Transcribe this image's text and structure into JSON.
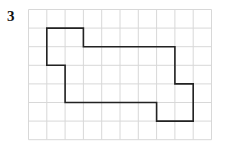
{
  "problem_number": "3",
  "grid": {
    "cols": 10,
    "rows": 7,
    "origin_x": 28.5,
    "origin_y": 9.5,
    "cell_w": 18.3,
    "cell_h": 18.6,
    "line_color": "#d8d8d8"
  },
  "shape": {
    "stroke": "#222222",
    "vertices": [
      [
        1,
        1
      ],
      [
        3,
        1
      ],
      [
        3,
        2
      ],
      [
        8,
        2
      ],
      [
        8,
        4
      ],
      [
        9,
        4
      ],
      [
        9,
        6
      ],
      [
        7,
        6
      ],
      [
        7,
        5
      ],
      [
        2,
        5
      ],
      [
        2,
        3
      ],
      [
        1,
        3
      ]
    ]
  }
}
